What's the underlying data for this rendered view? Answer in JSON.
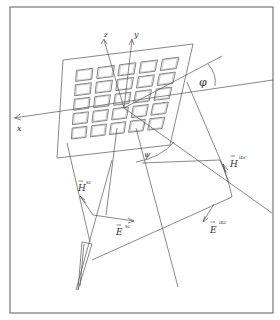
{
  "figure": {
    "type": "hand-drawn technical diagram",
    "grid": {
      "rows": 5,
      "cols": 5
    },
    "labels": {
      "axis_x": "x",
      "axis_y": "y",
      "axis_z": "z",
      "angle_phi": "φ",
      "angle_psi": "ψ",
      "h_sc": "H",
      "h_sc_sup": "sc",
      "e_sc": "E",
      "e_sc_sup": "sc",
      "h_inc": "H",
      "h_inc_sup": "inc",
      "e_inc": "E",
      "e_inc_sup": "inc",
      "vec_arrow": "→"
    },
    "colors": {
      "line": "#555555",
      "frame": "#777777",
      "background": "#ffffff"
    }
  }
}
